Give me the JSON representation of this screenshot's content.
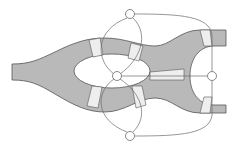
{
  "diagram": {
    "colors": {
      "background": "#ffffff",
      "river": "#b9b9b9",
      "river_edge": "#555555",
      "bridge": "#eeeeee",
      "graph_line": "#6a6a6a",
      "node_fill": "#ffffff",
      "node_stroke": "#6a6a6a"
    },
    "nodes": [
      {
        "id": "north-bank",
        "x": 130,
        "y": 14
      },
      {
        "id": "island",
        "x": 117,
        "y": 76
      },
      {
        "id": "east-bank",
        "x": 212,
        "y": 76
      },
      {
        "id": "south-bank",
        "x": 130,
        "y": 136
      }
    ],
    "bridge_count": 7,
    "edge_count": 7
  }
}
